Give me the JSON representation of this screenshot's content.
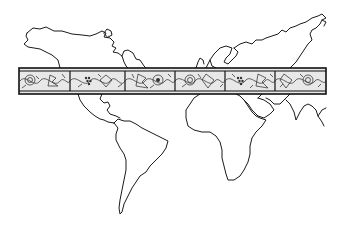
{
  "image": {
    "type": "illustration",
    "subject": "world-map-line-drawing",
    "background_color": "#ffffff",
    "line_color": "#1a1a1a"
  },
  "map": {
    "continents": [
      {
        "name": "North America",
        "visible": true
      },
      {
        "name": "Central America",
        "visible": true
      },
      {
        "name": "South America",
        "visible": true
      },
      {
        "name": "Greenland",
        "visible": true
      },
      {
        "name": "Europe",
        "visible": true
      },
      {
        "name": "Asia",
        "visible": true
      },
      {
        "name": "Africa",
        "visible": true
      },
      {
        "name": "Arabian Peninsula",
        "visible": true
      },
      {
        "name": "Indian Subcontinent",
        "visible": true
      }
    ],
    "decorative_band": {
      "style": "engraved vine and leaf ornament",
      "x": 19,
      "y": 68,
      "width": 307,
      "height": 26,
      "panel_dividers_x": [
        70,
        125,
        175,
        225,
        275
      ],
      "fill_color": "#e8e8e8",
      "border_color": "#111111"
    }
  }
}
